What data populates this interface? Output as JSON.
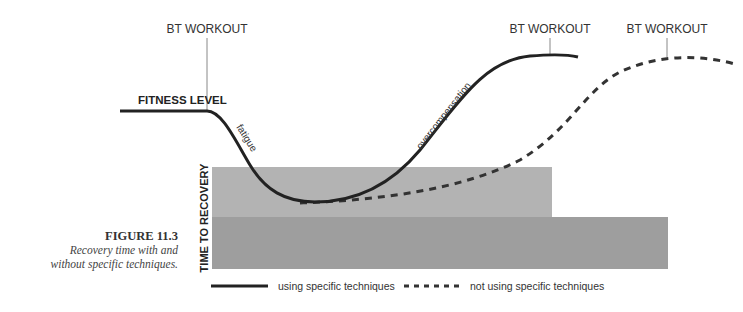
{
  "figure": {
    "title": "FIGURE 11.3",
    "caption_line1": "Recovery time with and",
    "caption_line2": "without specific techniques."
  },
  "labels": {
    "workout_1": "BT WORKOUT",
    "workout_2": "BT WORKOUT",
    "workout_3": "BT WORKOUT",
    "fitness_level": "FITNESS LEVEL",
    "time_to_recovery": "TIME TO RECOVERY",
    "fatigue": "fatigue",
    "overcompensation": "overcompensation"
  },
  "legend": {
    "solid": "using specific techniques",
    "dashed": "not using specific techniques"
  },
  "colors": {
    "curve": "#222222",
    "bar_light": "#b3b3b3",
    "bar_dark": "#9e9e9e",
    "marker_line": "#888888"
  }
}
